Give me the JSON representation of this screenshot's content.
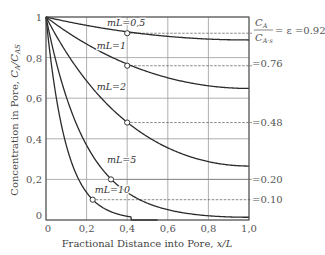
{
  "chart_data": {
    "type": "line",
    "title": "",
    "xlabel": "Fractional Distance into Pore, x/L",
    "ylabel": "Concentration in Pore, C_A/C_AS",
    "xlim": [
      0,
      1.0
    ],
    "ylim": [
      0,
      1.0
    ],
    "grid": true,
    "x_ticks": [
      "0",
      "0.2",
      "0.4",
      "0.6",
      "0.8",
      "1.0"
    ],
    "y_ticks": [
      "0",
      "0.2",
      "0.4",
      "0.6",
      "0.8",
      "1"
    ],
    "x_tick_values": [
      0,
      0.2,
      0.4,
      0.6,
      0.8,
      1.0
    ],
    "y_tick_values": [
      0,
      0.2,
      0.4,
      0.6,
      0.8,
      1.0
    ],
    "formula": "C_A/C_AS = cosh(mL(1 - x/L)) / cosh(mL)",
    "series": [
      {
        "name": "mL=0.5",
        "mL": 0.5,
        "label_x": 0.3,
        "label_y": 0.955,
        "marker_x": 0.4,
        "marker_y": 0.92,
        "end_value": 0.89
      },
      {
        "name": "mL=1",
        "mL": 1,
        "label_x": 0.25,
        "label_y": 0.84,
        "marker_x": 0.4,
        "marker_y": 0.76,
        "end_value": 0.65
      },
      {
        "name": "mL=2",
        "mL": 2,
        "label_x": 0.25,
        "label_y": 0.64,
        "marker_x": 0.4,
        "marker_y": 0.48,
        "end_value": 0.27
      },
      {
        "name": "mL=5",
        "mL": 5,
        "label_x": 0.3,
        "label_y": 0.28,
        "marker_x": 0.32,
        "marker_y": 0.2,
        "end_value": 0.01
      },
      {
        "name": "mL=10",
        "mL": 10,
        "label_x": 0.24,
        "label_y": 0.135,
        "marker_x": 0.23,
        "marker_y": 0.1,
        "end_value": 0.0
      }
    ],
    "annotations": [
      {
        "text": "C_A / C_A·s = ε = 0.92",
        "value": 0.92
      },
      {
        "text": "=0.76",
        "value": 0.76
      },
      {
        "text": "=0.48",
        "value": 0.48
      },
      {
        "text": "=0.20",
        "value": 0.2
      },
      {
        "text": "=0.10",
        "value": 0.1
      }
    ]
  },
  "labels": {
    "x_axis_title_prefix": "Fractional Distance into Pore, ",
    "x_axis_title_var": "x/L",
    "y_axis_title_prefix": "Concentration in Pore, ",
    "y_axis_title_var": "C",
    "y_axis_title_sub1": "A",
    "y_axis_title_slash": "/C",
    "y_axis_title_sub2": "AS",
    "eff_num": "C",
    "eff_num_sub": "A",
    "eff_den": "C",
    "eff_den_sub": "A·s",
    "eff_eq": "= ε =0.92",
    "eff_2": "=0.76",
    "eff_3": "=0.48",
    "eff_4": "=0.20",
    "eff_5": "=0.10",
    "series_labels": [
      "mL=0.5",
      "mL=1",
      "mL=2",
      "mL=5",
      "mL=10"
    ]
  }
}
